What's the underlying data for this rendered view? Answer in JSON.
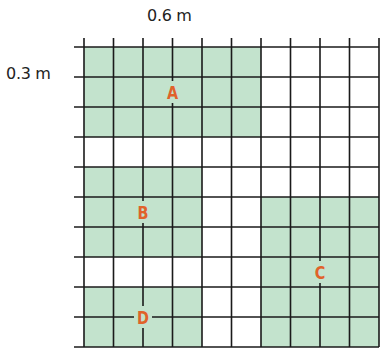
{
  "diagram": {
    "top_dimension_label": "0.6 m",
    "side_dimension_label": "0.3 m",
    "grid": {
      "rows": 10,
      "cols": 10
    },
    "colors": {
      "fill": "#c3e3cd",
      "grid_line": "#1a1a1a",
      "label": "#e0622a",
      "background": "#ffffff"
    },
    "regions": [
      {
        "label": "A",
        "row": 0,
        "col": 0,
        "rows": 3,
        "cols": 6,
        "label_row": 1.5,
        "label_col": 3
      },
      {
        "label": "B",
        "row": 4,
        "col": 0,
        "rows": 3,
        "cols": 4,
        "label_row": 5.5,
        "label_col": 2
      },
      {
        "label": "C",
        "row": 5,
        "col": 6,
        "rows": 5,
        "cols": 4,
        "label_row": 7.5,
        "label_col": 8
      },
      {
        "label": "D",
        "row": 8,
        "col": 0,
        "rows": 2,
        "cols": 4,
        "label_row": 9,
        "label_col": 2
      }
    ]
  }
}
